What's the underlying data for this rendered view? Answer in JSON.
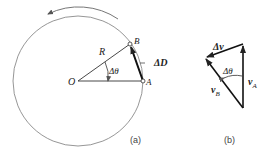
{
  "figure_a": {
    "caption": "(a)",
    "labels": {
      "center": "O",
      "point_a": "A",
      "point_b": "B",
      "radius": "R",
      "angle": "Δθ",
      "displacement": "ΔD"
    }
  },
  "figure_b": {
    "caption": "(b)",
    "labels": {
      "delta_v": "Δv",
      "angle": "Δθ",
      "v_a": "v",
      "v_a_sub": "A",
      "v_b": "v",
      "v_b_sub": "B"
    }
  },
  "colors": {
    "stroke": "#222222",
    "circle": "#8a8a8a"
  }
}
